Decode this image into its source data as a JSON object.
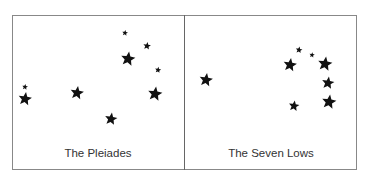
{
  "panels": [
    {
      "caption": "The Pleiades",
      "stars": [
        {
          "x": 25,
          "y": 87,
          "r": 3
        },
        {
          "x": 25,
          "y": 99,
          "r": 7
        },
        {
          "x": 77,
          "y": 93,
          "r": 7
        },
        {
          "x": 111,
          "y": 119,
          "r": 6.5
        },
        {
          "x": 125,
          "y": 33,
          "r": 3
        },
        {
          "x": 147,
          "y": 46,
          "r": 4
        },
        {
          "x": 128,
          "y": 59,
          "r": 7.5
        },
        {
          "x": 158,
          "y": 70,
          "r": 3.2
        },
        {
          "x": 155,
          "y": 94,
          "r": 7.5
        }
      ]
    },
    {
      "caption": "The Seven Lows",
      "stars": [
        {
          "x": 206,
          "y": 80,
          "r": 7
        },
        {
          "x": 290,
          "y": 65,
          "r": 7
        },
        {
          "x": 299,
          "y": 50,
          "r": 3.5
        },
        {
          "x": 312,
          "y": 55,
          "r": 2.8
        },
        {
          "x": 325,
          "y": 64,
          "r": 7.5
        },
        {
          "x": 328,
          "y": 83,
          "r": 6.5
        },
        {
          "x": 329,
          "y": 102,
          "r": 7.5
        },
        {
          "x": 294,
          "y": 106,
          "r": 5.5
        }
      ]
    }
  ],
  "colors": {
    "star": "#111111",
    "border": "#888888",
    "caption": "#333333"
  }
}
